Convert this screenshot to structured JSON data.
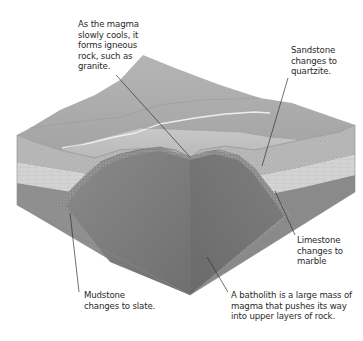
{
  "diagram": {
    "labels": {
      "igneous": "As the magma\nslowly cools, it\nforms igneous\nrock, such as\ngranite.",
      "sandstone": "Sandstone\nchanges to\nquartzite.",
      "limestone": "Limestone\nchanges to\nmarble",
      "mudstone": "Mudstone\nchanges to slate.",
      "batholith": "A batholith is a large mass of\nmagma that pushes its way\ninto upper layers of rock."
    },
    "layers": [
      {
        "name": "surface",
        "color": "#a9a9a9"
      },
      {
        "name": "sandstone-layer",
        "color": "#bdbdbd"
      },
      {
        "name": "limestone-layer",
        "color": "#d0d0d0"
      },
      {
        "name": "mudstone-layer",
        "color": "#8e8e8e"
      },
      {
        "name": "batholith",
        "color": "#7b7b7b"
      }
    ],
    "colors": {
      "background": "#ffffff",
      "text": "#2a2a2a",
      "leader_line": "#333333"
    }
  }
}
